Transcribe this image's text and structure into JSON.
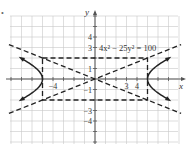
{
  "marker": "•",
  "chart_data": {
    "type": "line",
    "title": "",
    "equation_label": "4x² − 25y² = 100",
    "xlabel": "x",
    "ylabel": "y",
    "xlim": [
      -8,
      8
    ],
    "ylim": [
      -6,
      6
    ],
    "grid": true,
    "x_tick_labels": [
      {
        "value": -4,
        "text": "−4"
      },
      {
        "value": 3,
        "text": "3"
      },
      {
        "value": 4,
        "text": "4"
      }
    ],
    "y_tick_labels": [
      {
        "value": 4,
        "text": "4"
      },
      {
        "value": 3,
        "text": "3"
      },
      {
        "value": 1,
        "text": "1"
      },
      {
        "value": -1,
        "text": "−1"
      },
      {
        "value": -3,
        "text": "−3"
      },
      {
        "value": -4,
        "text": "−4"
      }
    ],
    "series": [
      {
        "name": "hyperbola right branch",
        "style": "solid",
        "a": 5,
        "b": 2,
        "branch": "right"
      },
      {
        "name": "hyperbola left branch",
        "style": "solid",
        "a": 5,
        "b": 2,
        "branch": "left"
      },
      {
        "name": "asymptote y = 2/5 x",
        "style": "dashed",
        "slope": 0.4
      },
      {
        "name": "asymptote y = -2/5 x",
        "style": "dashed",
        "slope": -0.4
      },
      {
        "name": "fundamental rectangle",
        "style": "dashed",
        "x": [
          -5,
          5
        ],
        "y": [
          -2,
          2
        ]
      }
    ],
    "vertices": [
      [
        -5,
        0
      ],
      [
        5,
        0
      ]
    ]
  },
  "layout": {
    "origin_px": [
      95,
      79
    ],
    "unit_px": 10.5,
    "grid_left": 10,
    "grid_right": 178,
    "grid_top": 16,
    "grid_bottom": 144,
    "colors": {
      "grid": "#c8c8c8",
      "axis": "#555555",
      "curve": "#222222",
      "dash": "#222222"
    }
  }
}
